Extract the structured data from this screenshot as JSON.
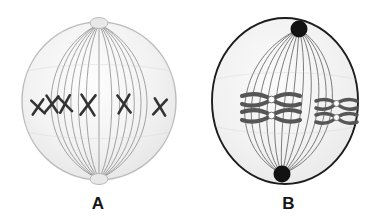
{
  "figure": {
    "background_color": "#ffffff",
    "width": 381,
    "height": 221,
    "panels": [
      {
        "id": "A",
        "label": "A",
        "shape": "sphere",
        "cell_fill": "#f2f2f2",
        "cell_outline": "#b9b9b9",
        "spindle_color": "#8a8a8a",
        "pole_style": "light-circle",
        "pole_color": "#e2e2e2",
        "chromosome_color": "#3a3a3a",
        "chromosome_count": 6,
        "chromosome_shape": "x-shaped",
        "centromere_visible": false,
        "description": "Spherical cell with vertical spindle fibers and six X-shaped chromosomes aligned across the equator"
      },
      {
        "id": "B",
        "label": "B",
        "shape": "oval",
        "cell_fill": "#f0f0f0",
        "cell_outline": "#1b1b1b",
        "spindle_color": "#6f6f6f",
        "pole_style": "dark-circle",
        "pole_color": "#111111",
        "chromosome_color": "#545454",
        "chromosome_count": 4,
        "chromosome_shape": "x-shaped-paired",
        "centromere_visible": true,
        "centromere_color": "#ffffff",
        "description": "Oval cell with dark poles, spindle fibers and two pairs of X-shaped chromosomes with white centromeres"
      }
    ]
  }
}
